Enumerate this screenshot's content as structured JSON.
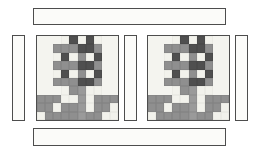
{
  "figure": {
    "background_color": "#ffffff",
    "width": 259,
    "height": 157
  },
  "palette": {
    "outline": "#4d4d4d",
    "background_fabric": "#f4f4ef",
    "light_fabric": "#f2f2ec",
    "medium_fabric": "#8f8f8f",
    "dark_fabric": "#4f4f4f",
    "stem_fabric": "#9a9a9a",
    "page_background": "#ffffff"
  },
  "sashing": {
    "top_bar": {
      "name": "top-horizontal-sashing",
      "x": 33,
      "y": 8,
      "width": 193,
      "height": 17,
      "fill": "#fbfbf9"
    },
    "bottom_bar": {
      "name": "bottom-horizontal-sashing",
      "x": 33,
      "y": 128,
      "width": 193,
      "height": 18,
      "fill": "#fbfbf9"
    },
    "left_strip": {
      "name": "left-vertical-sashing",
      "x": 12,
      "y": 35,
      "width": 13,
      "height": 86,
      "fill": "#fbfbf9"
    },
    "middle_strip": {
      "name": "middle-vertical-sashing",
      "x": 124,
      "y": 35,
      "width": 13,
      "height": 86,
      "fill": "#fbfbf9"
    },
    "right_strip": {
      "name": "right-vertical-sashing",
      "x": 235,
      "y": 35,
      "width": 13,
      "height": 86,
      "fill": "#fbfbf9"
    }
  },
  "blocks": [
    {
      "name": "tree-block-left",
      "label": "Tree Block 1",
      "x": 36,
      "y": 35,
      "width": 83,
      "height": 86,
      "columns": 10,
      "rows": 10
    },
    {
      "name": "tree-block-right",
      "label": "Tree Block 2",
      "x": 147,
      "y": 35,
      "width": 83,
      "height": 86,
      "columns": 10,
      "rows": 10
    }
  ],
  "block_pattern": {
    "description": "10x10 pieced tree: checkerboard canopy of dark and medium patches on light ground, wide medium branch bands, and a vertical stem with a light base row.",
    "legend": [
      {
        "code": "b",
        "name": "background",
        "color": "#f4f4ef"
      },
      {
        "code": "l",
        "name": "light patch",
        "color": "#f2f2ec"
      },
      {
        "code": "m",
        "name": "medium patch",
        "color": "#8f8f8f"
      },
      {
        "code": "d",
        "name": "dark patch",
        "color": "#4f4f4f"
      },
      {
        "code": "s",
        "name": "stem",
        "color": "#9a9a9a"
      }
    ],
    "rows": [
      [
        "b",
        "b",
        "b",
        "l",
        "d",
        "l",
        "d",
        "l",
        "b",
        "b"
      ],
      [
        "b",
        "b",
        "m",
        "m",
        "m",
        "d",
        "d",
        "m",
        "b",
        "b"
      ],
      [
        "b",
        "b",
        "l",
        "d",
        "l",
        "m",
        "l",
        "d",
        "b",
        "b"
      ],
      [
        "b",
        "b",
        "m",
        "m",
        "m",
        "d",
        "d",
        "m",
        "b",
        "b"
      ],
      [
        "b",
        "b",
        "l",
        "d",
        "l",
        "m",
        "l",
        "d",
        "b",
        "b"
      ],
      [
        "b",
        "b",
        "m",
        "m",
        "m",
        "d",
        "d",
        "m",
        "b",
        "b"
      ],
      [
        "b",
        "b",
        "b",
        "l",
        "m",
        "s",
        "l",
        "l",
        "b",
        "b"
      ],
      [
        "m",
        "m",
        "m",
        "l",
        "l",
        "s",
        "l",
        "m",
        "m",
        "m"
      ],
      [
        "m",
        "m",
        "l",
        "m",
        "m",
        "s",
        "l",
        "m",
        "m",
        "l"
      ],
      [
        "l",
        "m",
        "m",
        "m",
        "m",
        "s",
        "m",
        "m",
        "l",
        "l"
      ]
    ]
  }
}
